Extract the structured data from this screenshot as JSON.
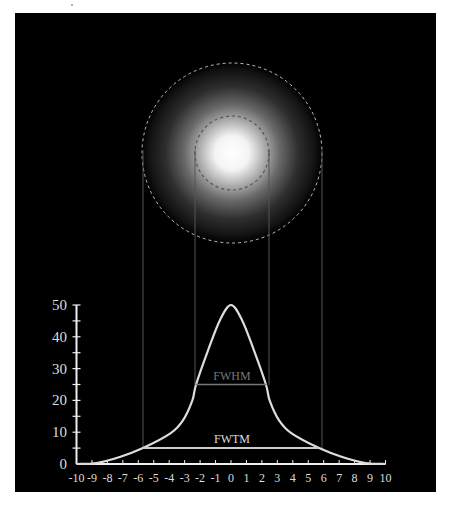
{
  "figure": {
    "background": "#000000",
    "panel": {
      "x": 15,
      "y": 13,
      "width": 421,
      "height": 479
    },
    "spot": {
      "center": [
        232,
        153
      ],
      "glow_radius": 95,
      "outer_circle": {
        "radius": 90,
        "color": "#bbbbbb",
        "label_meaning": "FWTM"
      },
      "inner_circle": {
        "radius": 37,
        "color": "#555555",
        "label_meaning": "FWHM"
      }
    },
    "projection_lines": {
      "color": "#555555",
      "fwtm": {
        "x_left": 143,
        "x_right": 322,
        "y_top": 150,
        "y_bottom": 448
      },
      "fwhm": {
        "x_left": 195,
        "x_right": 269,
        "y_top": 150,
        "y_bottom": 385
      }
    },
    "labels": {
      "fwhm": "FWHM",
      "fwtm": "FWTM"
    },
    "colors": {
      "curve": "#dddddd",
      "axis": "#eeeeee",
      "tick_label": "#dddddd",
      "fwhm_text": "#777777",
      "fwhm_line": "#777777",
      "fwtm_text": "#dddddd",
      "fwtm_line": "#cccccc"
    }
  },
  "chart_data": {
    "type": "line",
    "title": "",
    "xlabel": "",
    "ylabel": "",
    "xlim": [
      -10,
      10
    ],
    "ylim": [
      0,
      50
    ],
    "grid": false,
    "x_ticks": [
      -10,
      -9,
      -8,
      -7,
      -6,
      -5,
      -4,
      -3,
      -2,
      -1,
      0,
      1,
      2,
      3,
      4,
      5,
      6,
      7,
      8,
      9,
      10
    ],
    "x_tick_labels": [
      "-10",
      "-9",
      "-8",
      "-7",
      "-6",
      "-5",
      "-4",
      "-3",
      "-2",
      "-1",
      "0",
      "1",
      "2",
      "3",
      "4",
      "5",
      "6",
      "7",
      "8",
      "9",
      "10"
    ],
    "y_ticks_minor": [
      0,
      5,
      10,
      15,
      20,
      25,
      30,
      35,
      40,
      45,
      50
    ],
    "y_tick_labels": [
      "0",
      "10",
      "20",
      "30",
      "40",
      "50"
    ],
    "y_tick_label_values": [
      0,
      10,
      20,
      30,
      40,
      50
    ],
    "series": [
      {
        "name": "intensity profile",
        "x": [
          -10,
          -8.7,
          -7.2,
          -5.7,
          -3.9,
          -3.1,
          -2.5,
          -2.26,
          -1.48,
          -0.71,
          0,
          0.71,
          1.48,
          2.26,
          2.5,
          3.1,
          3.9,
          5.7,
          7.2,
          8.7,
          10
        ],
        "y": [
          0,
          0.3,
          2.2,
          5,
          9.7,
          13.8,
          20,
          25,
          35.8,
          45.3,
          50,
          45.3,
          35.8,
          25,
          20,
          13.8,
          9.7,
          5,
          2.2,
          0.3,
          0
        ]
      }
    ],
    "annotations": [
      {
        "text": "FWHM",
        "level": 25,
        "x_range": [
          -2.3,
          2.3
        ]
      },
      {
        "text": "FWTM",
        "level": 5,
        "x_range": [
          -5.7,
          5.7
        ]
      }
    ],
    "peak": {
      "x": 0,
      "y": 50
    }
  }
}
